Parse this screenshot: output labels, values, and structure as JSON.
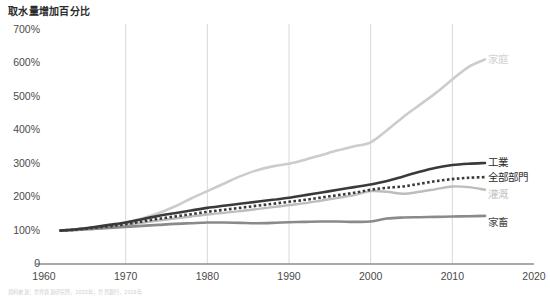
{
  "chart_data": {
    "type": "line",
    "title": "取水量增加百分比",
    "xlabel": "",
    "ylabel": "",
    "xlim": [
      1960,
      2020
    ],
    "ylim": [
      0,
      700
    ],
    "grid": "vertical-only",
    "legend_position": "right-inline-labels",
    "ytick_labels": [
      "700%",
      "600%",
      "500%",
      "400%",
      "300%",
      "200%",
      "100%",
      "0"
    ],
    "ytick_values": [
      700,
      600,
      500,
      400,
      300,
      200,
      100,
      0
    ],
    "xtick_labels": [
      "1960",
      "1970",
      "1980",
      "1990",
      "2000",
      "2010",
      "2020"
    ],
    "xtick_values": [
      1960,
      1970,
      1980,
      1990,
      2000,
      2010,
      2020
    ],
    "x": [
      1962,
      1964,
      1966,
      1968,
      1970,
      1972,
      1974,
      1976,
      1978,
      1980,
      1982,
      1984,
      1986,
      1988,
      1990,
      1992,
      1994,
      1996,
      1998,
      2000,
      2002,
      2004,
      2006,
      2008,
      2010,
      2012,
      2014
    ],
    "series": [
      {
        "name": "家庭",
        "name_en": "Domestic",
        "color": "#cccccc",
        "style": "solid",
        "width": 2.6,
        "label_color": "#d2d2d2",
        "values": [
          100,
          103,
          108,
          114,
          122,
          136,
          152,
          172,
          196,
          218,
          240,
          262,
          280,
          292,
          300,
          312,
          326,
          340,
          352,
          364,
          400,
          440,
          476,
          512,
          552,
          590,
          612
        ]
      },
      {
        "name": "工業",
        "name_en": "Industry",
        "color": "#3a3a3a",
        "style": "solid",
        "width": 2.6,
        "label_color": "#2b2b2b",
        "values": [
          100,
          104,
          110,
          117,
          124,
          134,
          144,
          152,
          160,
          168,
          174,
          180,
          186,
          192,
          198,
          206,
          214,
          222,
          230,
          238,
          248,
          262,
          276,
          288,
          296,
          300,
          302
        ]
      },
      {
        "name": "全部部門",
        "name_en": "All sectors",
        "color": "#3a3a3a",
        "style": "dotted",
        "width": 2.6,
        "label_color": "#2b2b2b",
        "values": [
          100,
          103,
          108,
          113,
          119,
          127,
          135,
          142,
          149,
          156,
          162,
          168,
          174,
          180,
          186,
          192,
          199,
          206,
          213,
          222,
          228,
          232,
          240,
          248,
          254,
          258,
          260
        ]
      },
      {
        "name": "灌溉",
        "name_en": "Irrigation",
        "color": "#bdbdbd",
        "style": "solid",
        "width": 2.4,
        "label_color": "#c4c4c4",
        "values": [
          100,
          102,
          106,
          111,
          116,
          123,
          130,
          136,
          142,
          148,
          153,
          158,
          164,
          170,
          176,
          182,
          190,
          198,
          206,
          218,
          216,
          210,
          216,
          224,
          232,
          230,
          222
        ]
      },
      {
        "name": "家畜",
        "name_en": "Livestock",
        "color": "#8a8a8a",
        "style": "solid",
        "width": 2.6,
        "label_color": "#4a4a4a",
        "values": [
          100,
          102,
          105,
          108,
          111,
          114,
          117,
          120,
          122,
          124,
          124,
          123,
          122,
          123,
          125,
          126,
          127,
          127,
          126,
          127,
          136,
          139,
          140,
          141,
          142,
          143,
          144
        ]
      }
    ]
  },
  "labels": {
    "domestic": "家庭",
    "industry": "工業",
    "all_sectors": "全部部門",
    "irrigation": "灌溉",
    "livestock": "家畜"
  },
  "caption": "資料來源：世界資源研究所，2023年；世界銀行，2019年"
}
